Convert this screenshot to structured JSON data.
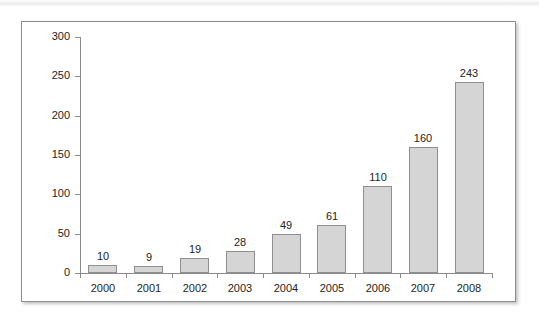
{
  "chart_data": {
    "type": "bar",
    "title": "",
    "subtitle": "",
    "xlabel": "",
    "ylabel": "",
    "categories": [
      "2000",
      "2001",
      "2002",
      "2003",
      "2004",
      "2005",
      "2006",
      "2007",
      "2008"
    ],
    "values": [
      10,
      9,
      19,
      28,
      49,
      61,
      110,
      160,
      243
    ],
    "value_labels": [
      "10",
      "9",
      "19",
      "28",
      "49",
      "61",
      "110",
      "160",
      "243"
    ],
    "ylim": [
      0,
      300
    ],
    "ytick_labels": [
      "0",
      "50",
      "100",
      "150",
      "200",
      "250",
      "300"
    ],
    "ytick_values": [
      0,
      50,
      100,
      150,
      200,
      250,
      300
    ],
    "grid": false,
    "legend": null,
    "legend_position": "none",
    "annotations": [],
    "series": [
      {
        "name": "",
        "values": [
          10,
          9,
          19,
          28,
          49,
          61,
          110,
          160,
          243
        ]
      }
    ],
    "colors": {
      "bar_fill": "#d5d5d5",
      "bar_stroke": "#8f8f8f",
      "axis": "#8a8a8a",
      "text": "#242424",
      "frame": "#8d8d8d",
      "background": "#ffffff"
    }
  }
}
